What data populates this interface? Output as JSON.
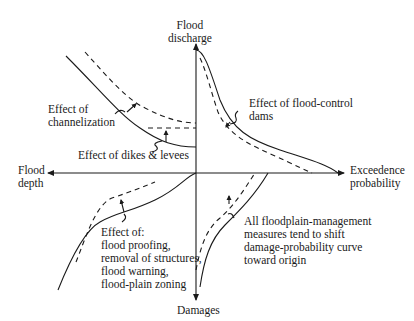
{
  "axes": {
    "y_top_label_line1": "Flood",
    "y_top_label_line2": "discharge",
    "y_bottom_label": "Damages",
    "x_left_label_line1": "Flood",
    "x_left_label_line2": "depth",
    "x_right_label_line1": "Exceedence",
    "x_right_label_line2": "probability"
  },
  "annotations": {
    "channelization_line1": "Effect of",
    "channelization_line2": "channelization",
    "dikes": "Effect of dikes & levees",
    "dams_line1": "Effect of flood-control",
    "dams_line2": "dams",
    "nonstructural": [
      "Effect of:",
      "flood proofing,",
      "removal of structures,",
      "flood warning,",
      "flood-plain zoning"
    ],
    "management": [
      "All floodplain-management",
      "measures tend to shift",
      "damage-probability curve",
      "toward origin"
    ]
  },
  "colors": {
    "line": "#1a1a1a",
    "background": "#ffffff"
  }
}
